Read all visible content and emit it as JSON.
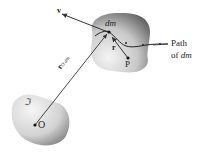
{
  "diagram": {
    "bodies": [
      {
        "id": "upper-body",
        "label": "dm",
        "point_label": "P"
      },
      {
        "id": "lower-body",
        "label": "ℑ",
        "point_label": "O"
      }
    ],
    "vectors": {
      "velocity": {
        "label": "v"
      },
      "position_from_O": {
        "label": "r",
        "subscript": "O dm"
      },
      "relative_position": {
        "label": "r"
      }
    },
    "path_label": {
      "line1": "Path",
      "line2_prefix": "of ",
      "line2_var": "dm"
    },
    "colors": {
      "body_light": "#f2f2f2",
      "body_dark": "#6e6e6e",
      "line": "#333333"
    }
  }
}
